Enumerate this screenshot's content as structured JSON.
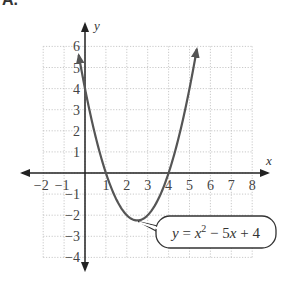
{
  "panel_label": "A.",
  "chart_data": {
    "type": "line",
    "title": "",
    "xlabel": "x",
    "ylabel": "y",
    "xlim": [
      -2,
      8
    ],
    "ylim": [
      -4,
      6
    ],
    "grid": true,
    "x_ticks": [
      -2,
      -1,
      1,
      2,
      3,
      4,
      5,
      6,
      7,
      8
    ],
    "y_ticks": [
      -4,
      -3,
      -2,
      -1,
      1,
      2,
      3,
      4,
      5,
      6
    ],
    "x_tick_labels": [
      "−2",
      "−1",
      "1",
      "2",
      "3",
      "4",
      "5",
      "6",
      "7",
      "8"
    ],
    "y_tick_labels": [
      "−4",
      "−3",
      "−2",
      "−1",
      "1",
      "2",
      "3",
      "4",
      "5",
      "6"
    ],
    "series": [
      {
        "name": "y = x^2 - 5x + 4",
        "equation": "y = x² − 5x + 4",
        "x_range": [
          -0.3,
          5.35
        ],
        "vertex": [
          2.5,
          -2.25
        ],
        "x_intercepts": [
          1,
          4
        ],
        "y_intercept": 4
      }
    ],
    "annotation": {
      "label_y": "y",
      "label_eq": " = x",
      "superscript": "2",
      "label_rest": " − 5x + 4"
    }
  }
}
